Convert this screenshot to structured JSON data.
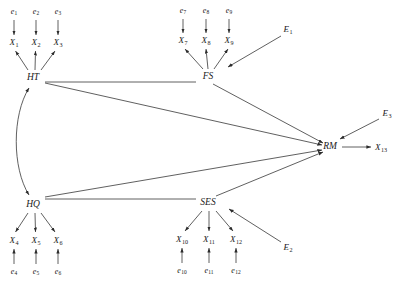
{
  "diagram": {
    "type": "structural-equation-model-path-diagram",
    "stroke_color": "#2b2b2b",
    "background": "#ffffff",
    "latent_variables": [
      {
        "id": "HT",
        "label": "HT",
        "x": 33,
        "y": 78
      },
      {
        "id": "FS",
        "label": "FS",
        "x": 208,
        "y": 77
      },
      {
        "id": "HQ",
        "label": "HQ",
        "x": 33,
        "y": 205
      },
      {
        "id": "SES",
        "label": "SES",
        "x": 208,
        "y": 203
      },
      {
        "id": "RM",
        "label": "RM",
        "x": 330,
        "y": 147
      }
    ],
    "observed_variables": [
      {
        "id": "X1",
        "base": "X",
        "sub": "1",
        "x": 14,
        "y": 43
      },
      {
        "id": "X2",
        "base": "X",
        "sub": "2",
        "x": 36,
        "y": 43
      },
      {
        "id": "X3",
        "base": "X",
        "sub": "3",
        "x": 58,
        "y": 43
      },
      {
        "id": "X7",
        "base": "X",
        "sub": "7",
        "x": 183,
        "y": 41
      },
      {
        "id": "X8",
        "base": "X",
        "sub": "8",
        "x": 206,
        "y": 41
      },
      {
        "id": "X9",
        "base": "X",
        "sub": "9",
        "x": 229,
        "y": 41
      },
      {
        "id": "X4",
        "base": "X",
        "sub": "4",
        "x": 14,
        "y": 241
      },
      {
        "id": "X5",
        "base": "X",
        "sub": "5",
        "x": 36,
        "y": 241
      },
      {
        "id": "X6",
        "base": "X",
        "sub": "6",
        "x": 58,
        "y": 241
      },
      {
        "id": "X10",
        "base": "X",
        "sub": "10",
        "x": 182,
        "y": 240
      },
      {
        "id": "X11",
        "base": "X",
        "sub": "11",
        "x": 209,
        "y": 240
      },
      {
        "id": "X12",
        "base": "X",
        "sub": "12",
        "x": 236,
        "y": 240
      },
      {
        "id": "X13",
        "base": "X",
        "sub": "13",
        "x": 381,
        "y": 148
      }
    ],
    "error_terms": [
      {
        "id": "e1",
        "base": "e",
        "sub": "1",
        "x": 14,
        "y": 12
      },
      {
        "id": "e2",
        "base": "e",
        "sub": "2",
        "x": 36,
        "y": 12
      },
      {
        "id": "e3",
        "base": "e",
        "sub": "3",
        "x": 58,
        "y": 12
      },
      {
        "id": "e7",
        "base": "e",
        "sub": "7",
        "x": 183,
        "y": 11
      },
      {
        "id": "e8",
        "base": "e",
        "sub": "8",
        "x": 206,
        "y": 11
      },
      {
        "id": "e9",
        "base": "e",
        "sub": "9",
        "x": 229,
        "y": 11
      },
      {
        "id": "e4",
        "base": "e",
        "sub": "4",
        "x": 14,
        "y": 272
      },
      {
        "id": "e5",
        "base": "e",
        "sub": "5",
        "x": 36,
        "y": 272
      },
      {
        "id": "e6",
        "base": "e",
        "sub": "6",
        "x": 58,
        "y": 272
      },
      {
        "id": "e10",
        "base": "e",
        "sub": "10",
        "x": 182,
        "y": 271
      },
      {
        "id": "e11",
        "base": "e",
        "sub": "11",
        "x": 209,
        "y": 271
      },
      {
        "id": "e12",
        "base": "e",
        "sub": "12",
        "x": 236,
        "y": 271
      }
    ],
    "disturbances": [
      {
        "id": "E1",
        "base": "E",
        "sub": "1",
        "x": 288,
        "y": 30
      },
      {
        "id": "E3",
        "base": "E",
        "sub": "3",
        "x": 387,
        "y": 114
      },
      {
        "id": "E2",
        "base": "E",
        "sub": "2",
        "x": 288,
        "y": 248
      }
    ],
    "covariance": {
      "id": "HT-HQ",
      "label": "HT ↔ HQ",
      "style": "curved-double-headed"
    },
    "structural_paths": [
      {
        "from": "HT",
        "to": "FS"
      },
      {
        "from": "HQ",
        "to": "SES"
      },
      {
        "from": "HT",
        "to": "RM"
      },
      {
        "from": "FS",
        "to": "RM"
      },
      {
        "from": "HQ",
        "to": "RM"
      },
      {
        "from": "SES",
        "to": "RM"
      },
      {
        "from": "RM",
        "to": "X13"
      },
      {
        "from": "E1",
        "to": "FS"
      },
      {
        "from": "E2",
        "to": "SES"
      },
      {
        "from": "E3",
        "to": "RM"
      }
    ],
    "measurement_paths": [
      {
        "from": "HT",
        "to": "X1"
      },
      {
        "from": "HT",
        "to": "X2"
      },
      {
        "from": "HT",
        "to": "X3"
      },
      {
        "from": "FS",
        "to": "X7"
      },
      {
        "from": "FS",
        "to": "X8"
      },
      {
        "from": "FS",
        "to": "X9"
      },
      {
        "from": "HQ",
        "to": "X4"
      },
      {
        "from": "HQ",
        "to": "X5"
      },
      {
        "from": "HQ",
        "to": "X6"
      },
      {
        "from": "SES",
        "to": "X10"
      },
      {
        "from": "SES",
        "to": "X11"
      },
      {
        "from": "SES",
        "to": "X12"
      },
      {
        "from": "e1",
        "to": "X1"
      },
      {
        "from": "e2",
        "to": "X2"
      },
      {
        "from": "e3",
        "to": "X3"
      },
      {
        "from": "e7",
        "to": "X7"
      },
      {
        "from": "e8",
        "to": "X8"
      },
      {
        "from": "e9",
        "to": "X9"
      },
      {
        "from": "e4",
        "to": "X4"
      },
      {
        "from": "e5",
        "to": "X5"
      },
      {
        "from": "e6",
        "to": "X6"
      },
      {
        "from": "e10",
        "to": "X10"
      },
      {
        "from": "e11",
        "to": "X11"
      },
      {
        "from": "e12",
        "to": "X12"
      }
    ]
  }
}
